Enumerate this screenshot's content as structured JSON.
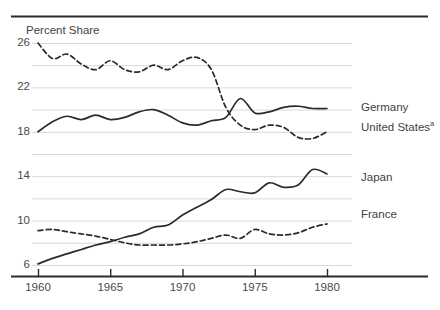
{
  "chart_data": {
    "type": "line",
    "title": "",
    "ylabel": "Percent Share",
    "xlabel": "",
    "xlim": [
      1960,
      1980
    ],
    "ylim": [
      6,
      26
    ],
    "grid": true,
    "gridlines_y": [
      6,
      8,
      10,
      12,
      14,
      16,
      18,
      20,
      22,
      24,
      26
    ],
    "legend_position": "right",
    "y_ticks": [
      {
        "value": 26,
        "label": "26"
      },
      {
        "value": 22,
        "label": "22"
      },
      {
        "value": 18,
        "label": "18"
      },
      {
        "value": 14,
        "label": "14"
      },
      {
        "value": 10,
        "label": "10"
      },
      {
        "value": 6,
        "label": "6"
      }
    ],
    "x_ticks": [
      {
        "value": 1960,
        "label": "1960"
      },
      {
        "value": 1965,
        "label": "1965"
      },
      {
        "value": 1970,
        "label": "1970"
      },
      {
        "value": 1975,
        "label": "1975"
      },
      {
        "value": 1980,
        "label": "1980"
      }
    ],
    "x": [
      1960,
      1961,
      1962,
      1963,
      1964,
      1965,
      1966,
      1967,
      1968,
      1969,
      1970,
      1971,
      1972,
      1973,
      1974,
      1975,
      1976,
      1977,
      1978,
      1979,
      1980
    ],
    "series": [
      {
        "name": "United States",
        "legend_label": "United States",
        "legend_footnote": "a",
        "style": "dashed",
        "color": "#2b2b2b",
        "values": [
          26.0,
          24.6,
          25.0,
          24.1,
          23.6,
          24.4,
          23.6,
          23.4,
          24.0,
          23.6,
          24.4,
          24.7,
          23.6,
          20.2,
          18.6,
          18.2,
          18.6,
          18.4,
          17.5,
          17.4,
          18.0
        ]
      },
      {
        "name": "Germany",
        "legend_label": "Germany",
        "legend_footnote": "",
        "style": "solid",
        "color": "#2b2b2b",
        "values": [
          18.0,
          18.9,
          19.4,
          19.1,
          19.5,
          19.1,
          19.3,
          19.8,
          20.0,
          19.5,
          18.8,
          18.6,
          19.0,
          19.3,
          21.0,
          19.7,
          19.8,
          20.2,
          20.3,
          20.1,
          20.1
        ]
      },
      {
        "name": "Japan",
        "legend_label": "Japan",
        "legend_footnote": "",
        "style": "solid",
        "color": "#2b2b2b",
        "values": [
          6.1,
          6.6,
          7.0,
          7.4,
          7.8,
          8.1,
          8.5,
          8.8,
          9.4,
          9.6,
          10.5,
          11.2,
          11.9,
          12.8,
          12.6,
          12.5,
          13.4,
          13.0,
          13.2,
          14.6,
          14.2
        ]
      },
      {
        "name": "France",
        "legend_label": "France",
        "legend_footnote": "",
        "style": "dashed",
        "color": "#2b2b2b",
        "values": [
          9.1,
          9.2,
          9.0,
          8.8,
          8.6,
          8.3,
          8.0,
          7.8,
          7.8,
          7.8,
          7.9,
          8.1,
          8.4,
          8.7,
          8.4,
          9.2,
          8.8,
          8.7,
          8.9,
          9.4,
          9.7
        ]
      }
    ]
  },
  "axis": {
    "y_title": "Percent Share"
  },
  "legend": {
    "entries": [
      {
        "label": "Germany",
        "footnote": ""
      },
      {
        "label": "United States",
        "footnote": "a"
      },
      {
        "label": "Japan",
        "footnote": ""
      },
      {
        "label": "France",
        "footnote": ""
      }
    ]
  }
}
